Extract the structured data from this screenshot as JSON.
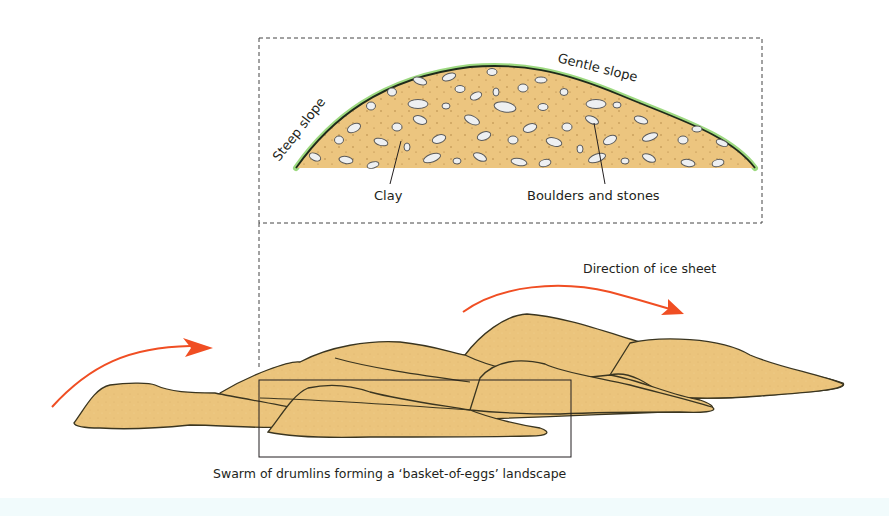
{
  "diagram": {
    "inset": {
      "labels": {
        "steep_slope": "Steep slope",
        "gentle_slope": "Gentle slope",
        "clay": "Clay",
        "boulders": "Boulders and stones"
      }
    },
    "landscape": {
      "direction_label": "Direction of ice sheet",
      "caption": "Swarm of drumlins forming a ‘basket-of-eggs’ landscape"
    },
    "colors": {
      "sediment_fill": "#ecc57f",
      "grass": "#6cbf4a",
      "outline": "#231f20",
      "stone_fill": "#eef0f2",
      "arrow": "#f04e23",
      "band": "#f1fbfc"
    }
  }
}
